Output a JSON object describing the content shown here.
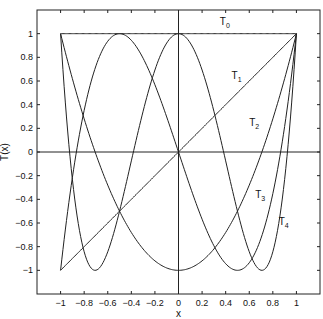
{
  "chart_data": {
    "type": "line",
    "title": "",
    "xlabel": "x",
    "ylabel": "T(x)",
    "xlim": [
      -1.2,
      1.2
    ],
    "ylim": [
      -1.2,
      1.2
    ],
    "grid": false,
    "reference_lines": {
      "x": 0,
      "y": 0
    },
    "xticks": [
      -1,
      -0.8,
      -0.6,
      -0.4,
      -0.2,
      0,
      0.2,
      0.4,
      0.6,
      0.8,
      1
    ],
    "xtick_labels": [
      "-1",
      "-0.8",
      "-0.6",
      "-0.4",
      "-0.2",
      "0",
      "0.2",
      "0.4",
      "0.6",
      "0.8",
      "1"
    ],
    "yticks": [
      -1,
      -0.8,
      -0.6,
      -0.4,
      -0.2,
      0,
      0.2,
      0.4,
      0.6,
      0.8,
      1
    ],
    "ytick_labels": [
      "-1",
      "-0.8",
      "-0.6",
      "-0.4",
      "-0.2",
      "0",
      "0.2",
      "0.4",
      "0.6",
      "0.8",
      "1"
    ],
    "series": [
      {
        "name": "T0",
        "label_base": "T",
        "label_sub": "0",
        "formula": "1",
        "x": [
          -1,
          1
        ],
        "values": [
          1,
          1
        ],
        "label_pos": [
          0.35,
          1.07
        ]
      },
      {
        "name": "T1",
        "label_base": "T",
        "label_sub": "1",
        "formula": "x",
        "x": [
          -1,
          1
        ],
        "values": [
          -1,
          1
        ],
        "label_pos": [
          0.45,
          0.62
        ]
      },
      {
        "name": "T2",
        "label_base": "T",
        "label_sub": "2",
        "formula": "2x^2-1",
        "x": [
          -1,
          -0.5,
          0,
          0.5,
          1
        ],
        "values": [
          1,
          -0.5,
          -1,
          -0.5,
          1
        ],
        "label_pos": [
          0.6,
          0.22
        ]
      },
      {
        "name": "T3",
        "label_base": "T",
        "label_sub": "3",
        "formula": "4x^3-3x",
        "x": [
          -1,
          -0.866,
          -0.5,
          0,
          0.5,
          0.866,
          1
        ],
        "values": [
          -1,
          0,
          1,
          0,
          -1,
          0,
          1
        ],
        "label_pos": [
          0.65,
          -0.39
        ]
      },
      {
        "name": "T4",
        "label_base": "T",
        "label_sub": "4",
        "formula": "8x^4-8x^2+1",
        "x": [
          -1,
          -0.707,
          0,
          0.707,
          1
        ],
        "values": [
          1,
          -1,
          1,
          -1,
          1
        ],
        "label_pos": [
          0.85,
          -0.62
        ]
      }
    ]
  }
}
